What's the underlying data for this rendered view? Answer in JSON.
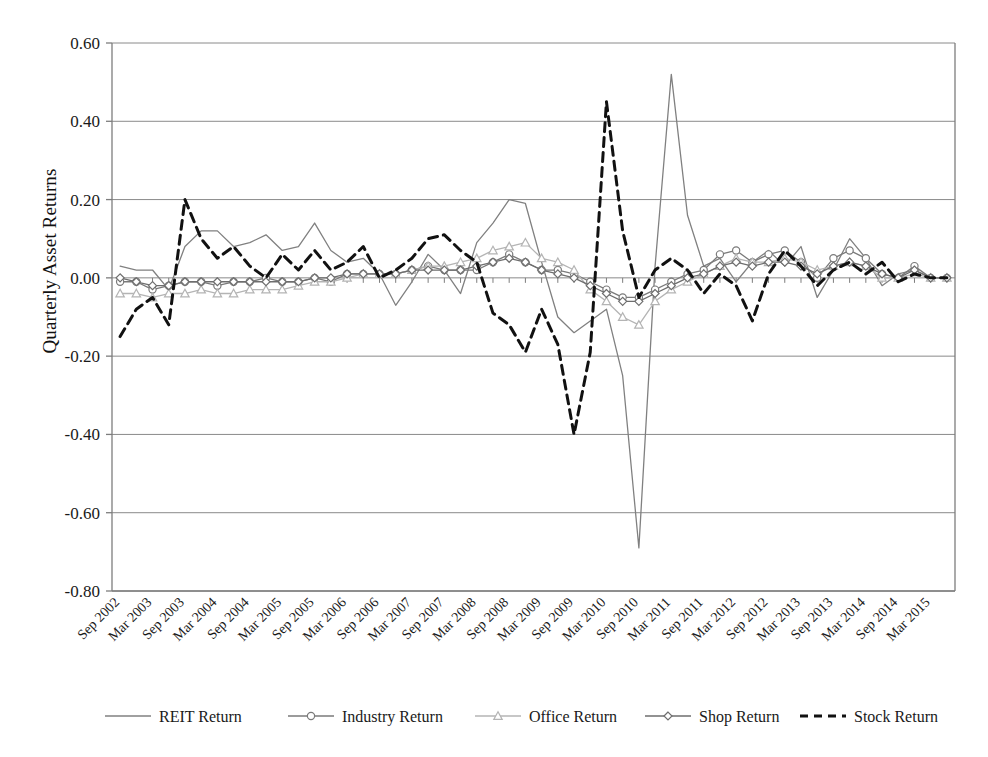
{
  "chart_data": {
    "type": "line",
    "title": "",
    "xlabel": "",
    "ylabel": "Quarterly Asset Returns",
    "ylim": [
      -0.8,
      0.6
    ],
    "yticks": [
      "0.60",
      "0.40",
      "0.20",
      "0.00",
      "-0.20",
      "-0.40",
      "-0.60",
      "-0.80"
    ],
    "ytick_values": [
      0.6,
      0.4,
      0.2,
      0.0,
      -0.2,
      -0.4,
      -0.6,
      -0.8
    ],
    "grid": true,
    "legend_position": "bottom",
    "x_tick_labels": [
      "Sep 2002",
      "Mar 2003",
      "Sep 2003",
      "Mar 2004",
      "Sep 2004",
      "Mar 2005",
      "Sep 2005",
      "Mar 2006",
      "Sep 2006",
      "Mar 2007",
      "Sep 2007",
      "Mar 2008",
      "Sep 2008",
      "Mar 2009",
      "Sep 2009",
      "Mar 2010",
      "Sep 2010",
      "Mar 2011",
      "Sep 2011",
      "Mar 2012",
      "Sep 2012",
      "Mar 2013",
      "Sep 2013",
      "Mar 2014",
      "Sep 2014",
      "Mar 2015"
    ],
    "x_quarters": [
      "Sep 2002",
      "Dec 2002",
      "Mar 2003",
      "Jun 2003",
      "Sep 2003",
      "Dec 2003",
      "Mar 2004",
      "Jun 2004",
      "Sep 2004",
      "Dec 2004",
      "Mar 2005",
      "Jun 2005",
      "Sep 2005",
      "Dec 2005",
      "Mar 2006",
      "Jun 2006",
      "Sep 2006",
      "Dec 2006",
      "Mar 2007",
      "Jun 2007",
      "Sep 2007",
      "Dec 2007",
      "Mar 2008",
      "Jun 2008",
      "Sep 2008",
      "Dec 2008",
      "Mar 2009",
      "Jun 2009",
      "Sep 2009",
      "Dec 2009",
      "Mar 2010",
      "Jun 2010",
      "Sep 2010",
      "Dec 2010",
      "Mar 2011",
      "Jun 2011",
      "Sep 2011",
      "Dec 2011",
      "Mar 2012",
      "Jun 2012",
      "Sep 2012",
      "Dec 2012",
      "Mar 2013",
      "Jun 2013",
      "Sep 2013",
      "Dec 2013",
      "Mar 2014",
      "Jun 2014",
      "Sep 2014",
      "Dec 2014",
      "Mar 2015",
      "Jun 2015"
    ],
    "series": [
      {
        "name": "REIT Return",
        "color": "#808080",
        "marker": "none",
        "dash": "none",
        "values": [
          0.03,
          0.02,
          0.02,
          -0.03,
          0.08,
          0.12,
          0.12,
          0.08,
          0.09,
          0.11,
          0.07,
          0.08,
          0.14,
          0.07,
          0.04,
          0.05,
          0.01,
          -0.07,
          -0.01,
          0.06,
          0.02,
          -0.04,
          0.09,
          0.14,
          0.2,
          0.19,
          0.04,
          -0.1,
          -0.14,
          -0.11,
          -0.08,
          -0.25,
          -0.69,
          0.03,
          0.52,
          0.16,
          0.03,
          0.05,
          -0.01,
          0.04,
          0.07,
          0.03,
          0.08,
          -0.05,
          0.02,
          0.1,
          0.05,
          -0.02,
          0.01,
          0.02,
          0.0,
          0.0
        ]
      },
      {
        "name": "Industry Return",
        "color": "#7a7a7a",
        "marker": "circle",
        "dash": "none",
        "values": [
          -0.01,
          -0.01,
          -0.03,
          -0.02,
          -0.01,
          -0.01,
          -0.02,
          -0.01,
          -0.01,
          0.0,
          -0.01,
          -0.01,
          0.0,
          -0.01,
          0.01,
          0.01,
          0.01,
          0.01,
          0.02,
          0.03,
          0.02,
          0.02,
          0.02,
          0.04,
          0.06,
          0.04,
          0.02,
          0.02,
          0.01,
          -0.01,
          -0.03,
          -0.05,
          -0.05,
          -0.03,
          -0.01,
          0.01,
          0.02,
          0.06,
          0.07,
          0.04,
          0.06,
          0.07,
          0.04,
          0.0,
          0.05,
          0.07,
          0.05,
          0.01,
          0.0,
          0.03,
          0.0,
          0.0
        ]
      },
      {
        "name": "Office Return",
        "color": "#b4b4b4",
        "marker": "triangle",
        "dash": "none",
        "values": [
          -0.04,
          -0.04,
          -0.05,
          -0.04,
          -0.04,
          -0.03,
          -0.04,
          -0.04,
          -0.03,
          -0.03,
          -0.03,
          -0.02,
          -0.01,
          -0.01,
          0.0,
          0.01,
          0.01,
          0.01,
          0.02,
          0.03,
          0.03,
          0.04,
          0.05,
          0.07,
          0.08,
          0.09,
          0.05,
          0.04,
          0.02,
          -0.03,
          -0.06,
          -0.1,
          -0.12,
          -0.06,
          -0.03,
          -0.01,
          0.01,
          0.03,
          0.05,
          0.04,
          0.04,
          0.05,
          0.04,
          0.02,
          0.03,
          0.04,
          0.03,
          0.0,
          0.0,
          0.01,
          0.0,
          0.0
        ]
      },
      {
        "name": "Shop Return",
        "color": "#6e6e6e",
        "marker": "diamond",
        "dash": "none",
        "values": [
          0.0,
          -0.01,
          -0.02,
          -0.02,
          -0.01,
          -0.01,
          -0.01,
          -0.01,
          -0.01,
          -0.01,
          -0.01,
          -0.01,
          0.0,
          0.0,
          0.01,
          0.01,
          0.01,
          0.01,
          0.02,
          0.02,
          0.02,
          0.02,
          0.03,
          0.04,
          0.05,
          0.04,
          0.02,
          0.01,
          0.0,
          -0.02,
          -0.04,
          -0.06,
          -0.06,
          -0.04,
          -0.02,
          0.0,
          0.01,
          0.03,
          0.04,
          0.03,
          0.04,
          0.04,
          0.03,
          0.01,
          0.03,
          0.04,
          0.03,
          0.01,
          0.0,
          0.02,
          0.0,
          0.0
        ]
      },
      {
        "name": "Stock Return",
        "color": "#111111",
        "marker": "none",
        "dash": "dashed",
        "values": [
          -0.15,
          -0.08,
          -0.05,
          -0.12,
          0.2,
          0.1,
          0.05,
          0.08,
          0.03,
          0.0,
          0.06,
          0.02,
          0.07,
          0.02,
          0.04,
          0.08,
          0.0,
          0.02,
          0.05,
          0.1,
          0.11,
          0.07,
          0.04,
          -0.09,
          -0.12,
          -0.19,
          -0.08,
          -0.17,
          -0.4,
          -0.19,
          0.45,
          0.12,
          -0.05,
          0.02,
          0.05,
          0.02,
          -0.04,
          0.01,
          -0.02,
          -0.11,
          0.01,
          0.07,
          0.03,
          -0.02,
          0.02,
          0.04,
          0.01,
          0.04,
          -0.01,
          0.01,
          0.0,
          0.0
        ]
      }
    ]
  },
  "legend": {
    "items": [
      {
        "label": "REIT Return"
      },
      {
        "label": "Industry Return"
      },
      {
        "label": "Office Return"
      },
      {
        "label": "Shop Return"
      },
      {
        "label": "Stock Return"
      }
    ]
  },
  "axis": {
    "y_title": "Quarterly Asset Returns"
  }
}
